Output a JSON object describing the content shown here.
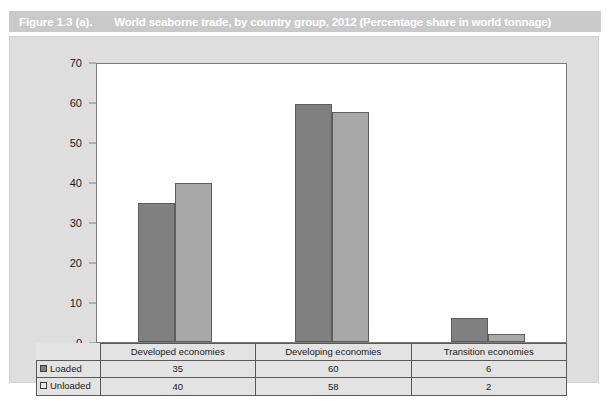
{
  "figure": {
    "number": "Figure 1.3 (a).",
    "title": "World seaborne trade, by country group, 2012 (Percentage share in world tonnage)"
  },
  "chart_data": {
    "type": "bar",
    "title": "World seaborne trade, by country group, 2012 (Percentage share in world tonnage)",
    "xlabel": "",
    "ylabel": "",
    "ylim": [
      0,
      70
    ],
    "yticks": [
      0,
      10,
      20,
      30,
      40,
      50,
      60,
      70
    ],
    "ytick_labels": [
      "0",
      "10",
      "20",
      "30",
      "40",
      "50",
      "60",
      "70"
    ],
    "grid": false,
    "legend_position": "table-left",
    "categories": [
      "Developed economies",
      "Developing economies",
      "Transition economies"
    ],
    "series": [
      {
        "name": "Loaded",
        "values": [
          35,
          60,
          6
        ],
        "color": "#808080"
      },
      {
        "name": "Unloaded",
        "values": [
          40,
          58,
          2
        ],
        "color": "#a8a8a8"
      }
    ]
  },
  "table": {
    "row_labels": [
      "Loaded",
      "Unloaded"
    ],
    "column_headers": [
      "Developed economies",
      "Developing economies",
      "Transition economies"
    ],
    "rows": [
      [
        "35",
        "60",
        "6"
      ],
      [
        "40",
        "58",
        "2"
      ]
    ]
  },
  "colors": {
    "title_bar": "#c9c9c9",
    "title_text": "#ffffff",
    "panel_bg": "#dedede",
    "plot_bg": "#ffffff",
    "loaded_bar": "#808080",
    "unloaded_bar": "#a8a8a8",
    "axis_line": "#7a7a7a",
    "table_border": "#58595b"
  }
}
